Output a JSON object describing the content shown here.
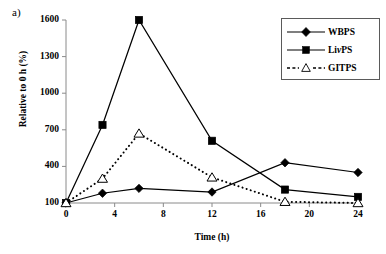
{
  "panel_label": "a)",
  "axes": {
    "x_title": "Time (h)",
    "y_title": "Relative to 0 h (%)",
    "x_ticks": [
      "0",
      "4",
      "8",
      "12",
      "16",
      "20",
      "24"
    ],
    "y_ticks": [
      "100",
      "400",
      "700",
      "1000",
      "1300",
      "1600"
    ]
  },
  "legend": {
    "position": "top-right",
    "items": [
      {
        "label": "WBPS",
        "marker": "filled-diamond",
        "line": "solid"
      },
      {
        "label": "LivPS",
        "marker": "filled-square",
        "line": "solid"
      },
      {
        "label": "GITPS",
        "marker": "open-triangle",
        "line": "dotted"
      }
    ]
  },
  "chart_data": {
    "type": "line",
    "title": "",
    "subtitle": "",
    "xlabel": "Time (h)",
    "ylabel": "Relative to 0 h (%)",
    "xlim": [
      0,
      24
    ],
    "ylim": [
      100,
      1600
    ],
    "x_ticks": [
      0,
      4,
      8,
      12,
      16,
      20,
      24
    ],
    "y_ticks": [
      100,
      400,
      700,
      1000,
      1300,
      1600
    ],
    "grid": false,
    "legend_position": "top-right",
    "annotations": [
      "a)"
    ],
    "x": [
      0,
      3,
      6,
      12,
      18,
      24
    ],
    "series": [
      {
        "name": "WBPS",
        "marker": "filled-diamond",
        "line": "solid",
        "values": [
          100,
          180,
          220,
          190,
          430,
          350
        ]
      },
      {
        "name": "LivPS",
        "marker": "filled-square",
        "line": "solid",
        "values": [
          100,
          740,
          1600,
          610,
          210,
          150
        ]
      },
      {
        "name": "GITPS",
        "marker": "open-triangle",
        "line": "dotted",
        "values": [
          100,
          300,
          670,
          310,
          110,
          100
        ]
      }
    ]
  }
}
